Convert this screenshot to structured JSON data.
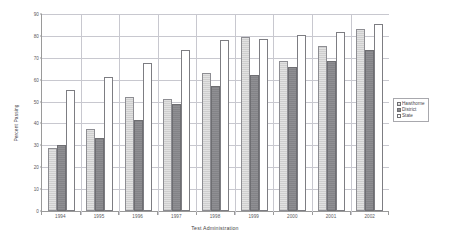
{
  "chart_data": {
    "type": "bar",
    "title": "",
    "xlabel": "Test Administration",
    "ylabel": "Percent Passing",
    "categories": [
      "1994",
      "1995",
      "1996",
      "1997",
      "1998",
      "1999",
      "2000",
      "2001",
      "2002"
    ],
    "series": [
      {
        "name": "Hawthorne",
        "color": "#e2e2e2",
        "values": [
          29,
          37.5,
          52,
          51,
          63,
          79.5,
          68.5,
          75.5,
          83
        ]
      },
      {
        "name": "District",
        "color": "#8f8f93",
        "values": [
          30,
          33.5,
          41.5,
          49,
          57,
          62,
          66,
          68.5,
          73.5
        ]
      },
      {
        "name": "State",
        "color": "#ffffff",
        "values": [
          55.5,
          61,
          67.5,
          73.5,
          78,
          78.5,
          80.5,
          82,
          85.5
        ]
      }
    ],
    "ylim": [
      0,
      90
    ],
    "yticks": [
      0,
      10,
      20,
      30,
      40,
      50,
      60,
      70,
      80,
      90
    ],
    "ytick_labels": [
      "0",
      "10",
      "20",
      "30",
      "40",
      "50",
      "60",
      "70",
      "80",
      "90"
    ],
    "grid": true,
    "grid_axis": "y",
    "legend_position": "right"
  },
  "legend": {
    "items": [
      {
        "label": "Hawthorne"
      },
      {
        "label": "District"
      },
      {
        "label": "State"
      }
    ]
  },
  "axes": {
    "x_title": "Test Administration",
    "y_title": "Percent Passing"
  }
}
